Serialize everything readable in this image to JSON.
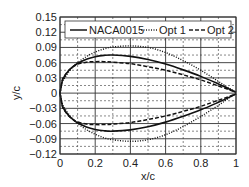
{
  "chart_data": {
    "type": "line",
    "title": "",
    "xlabel": "x/c",
    "ylabel": "y/c",
    "xlim": [
      0,
      1
    ],
    "ylim": [
      -0.12,
      0.15
    ],
    "xticks": [
      "0",
      "0.2",
      "0.4",
      "0.6",
      "0.8",
      "1"
    ],
    "yticks": [
      "0.15",
      "0.12",
      "0.09",
      "0.06",
      "0.03",
      "0",
      "-0.03",
      "-0.06",
      "-0.09",
      "-0.12"
    ],
    "grid": true,
    "legend_position": "top inside",
    "x": [
      0,
      0.0125,
      0.025,
      0.05,
      0.075,
      0.1,
      0.15,
      0.2,
      0.25,
      0.3,
      0.4,
      0.5,
      0.6,
      0.7,
      0.8,
      0.9,
      0.95,
      1.0
    ],
    "series": [
      {
        "name": "NACA0015",
        "style": "solid",
        "upper": [
          0,
          0.0237,
          0.0327,
          0.0444,
          0.0525,
          0.0585,
          0.0668,
          0.0717,
          0.0743,
          0.075,
          0.0724,
          0.0662,
          0.0572,
          0.0458,
          0.033,
          0.0181,
          0.0101,
          0.0016
        ],
        "lower": [
          0,
          -0.0237,
          -0.0327,
          -0.0444,
          -0.0525,
          -0.0585,
          -0.0668,
          -0.0717,
          -0.0743,
          -0.075,
          -0.0724,
          -0.0662,
          -0.0572,
          -0.0458,
          -0.033,
          -0.0181,
          -0.0101,
          -0.0016
        ]
      },
      {
        "name": "Opt 1",
        "style": "dotted",
        "upper": [
          0,
          0.02,
          0.029,
          0.042,
          0.052,
          0.06,
          0.072,
          0.081,
          0.087,
          0.091,
          0.093,
          0.09,
          0.08,
          0.064,
          0.045,
          0.023,
          0.012,
          0.0016
        ],
        "lower": [
          0,
          -0.02,
          -0.029,
          -0.042,
          -0.052,
          -0.06,
          -0.072,
          -0.081,
          -0.088,
          -0.092,
          -0.095,
          -0.092,
          -0.082,
          -0.066,
          -0.046,
          -0.024,
          -0.012,
          -0.0016
        ]
      },
      {
        "name": "Opt 2",
        "style": "dashed",
        "upper": [
          0,
          0.025,
          0.034,
          0.045,
          0.052,
          0.057,
          0.061,
          0.062,
          0.062,
          0.061,
          0.058,
          0.052,
          0.045,
          0.036,
          0.026,
          0.014,
          0.008,
          0.0016
        ],
        "lower": [
          0,
          -0.025,
          -0.034,
          -0.045,
          -0.052,
          -0.057,
          -0.061,
          -0.062,
          -0.062,
          -0.061,
          -0.058,
          -0.052,
          -0.045,
          -0.036,
          -0.026,
          -0.014,
          -0.008,
          -0.0016
        ]
      }
    ]
  },
  "legend": {
    "items": [
      "NACA0015",
      "Opt 1",
      "Opt 2"
    ]
  }
}
